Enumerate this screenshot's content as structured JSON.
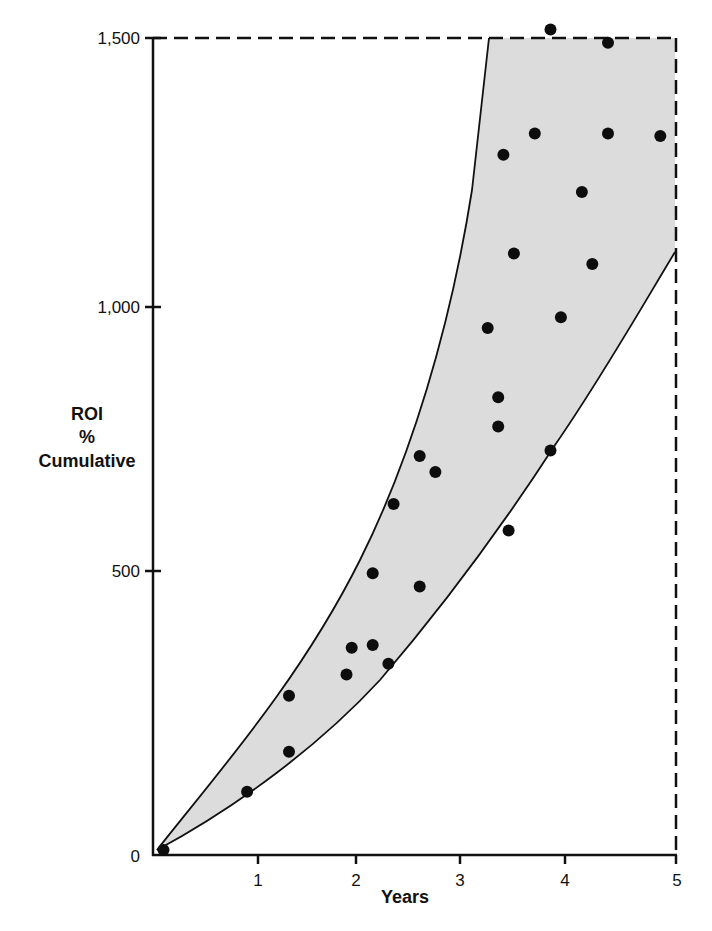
{
  "chart_data": {
    "type": "scatter",
    "title": "",
    "xlabel": "Years",
    "ylabel": "ROI % Cumulative",
    "ylabel_lines": [
      "ROI",
      "%",
      "Cumulative"
    ],
    "xlim": [
      0,
      5
    ],
    "ylim": [
      0,
      1500
    ],
    "x_ticks": [
      1,
      2,
      3,
      4,
      5
    ],
    "x_tick_labels": [
      "1",
      "2",
      "3",
      "4",
      "5"
    ],
    "y_ticks": [
      0,
      500,
      1000,
      1500
    ],
    "y_tick_labels": [
      "0",
      "500",
      "1,000",
      "1,500"
    ],
    "grid": false,
    "legend": null,
    "frame": {
      "top": "dashed",
      "right": "dashed",
      "left": "solid",
      "bottom": "solid"
    },
    "band": {
      "description": "Shaded range between upper and lower cumulative ROI curves",
      "fill_color": "#dcdcdc",
      "upper_curve": [
        [
          0,
          0
        ],
        [
          0.3,
          55
        ],
        [
          0.8,
          175
        ],
        [
          1.3,
          285
        ],
        [
          1.7,
          400
        ],
        [
          2.0,
          520
        ],
        [
          2.3,
          660
        ],
        [
          2.6,
          790
        ],
        [
          2.8,
          880
        ],
        [
          3.0,
          1000
        ],
        [
          3.1,
          1100
        ],
        [
          3.2,
          1270
        ],
        [
          3.3,
          1500
        ]
      ],
      "lower_curve": [
        [
          0,
          0
        ],
        [
          0.5,
          50
        ],
        [
          1.0,
          110
        ],
        [
          1.6,
          190
        ],
        [
          2.3,
          300
        ],
        [
          2.9,
          450
        ],
        [
          3.4,
          570
        ],
        [
          3.8,
          700
        ],
        [
          4.3,
          880
        ],
        [
          4.7,
          1020
        ],
        [
          5.0,
          1100
        ]
      ]
    },
    "series": [
      {
        "name": "Observed ROI",
        "marker": "circle",
        "color": "#0d0d0d",
        "points": [
          [
            0.1,
            0
          ],
          [
            0.9,
            85
          ],
          [
            1.3,
            160
          ],
          [
            1.3,
            265
          ],
          [
            1.85,
            305
          ],
          [
            1.9,
            355
          ],
          [
            2.1,
            360
          ],
          [
            2.25,
            325
          ],
          [
            2.1,
            495
          ],
          [
            2.55,
            470
          ],
          [
            2.3,
            625
          ],
          [
            2.55,
            715
          ],
          [
            2.7,
            685
          ],
          [
            3.3,
            825
          ],
          [
            3.3,
            770
          ],
          [
            3.4,
            575
          ],
          [
            3.8,
            725
          ],
          [
            3.2,
            955
          ],
          [
            3.9,
            975
          ],
          [
            3.45,
            1095
          ],
          [
            4.2,
            1075
          ],
          [
            3.35,
            1280
          ],
          [
            3.65,
            1320
          ],
          [
            4.35,
            1320
          ],
          [
            4.85,
            1315
          ],
          [
            4.1,
            1210
          ],
          [
            3.8,
            1515
          ],
          [
            4.35,
            1490
          ]
        ]
      }
    ]
  },
  "labels": {
    "x_axis_title": "Years",
    "y_axis_title_line1": "ROI",
    "y_axis_title_line2": "%",
    "y_axis_title_line3": "Cumulative",
    "x_tick_1": "1",
    "x_tick_2": "2",
    "x_tick_3": "3",
    "x_tick_4": "4",
    "x_tick_5": "5",
    "y_tick_0": "0",
    "y_tick_500": "500",
    "y_tick_1000": "1,000",
    "y_tick_1500": "1,500"
  }
}
